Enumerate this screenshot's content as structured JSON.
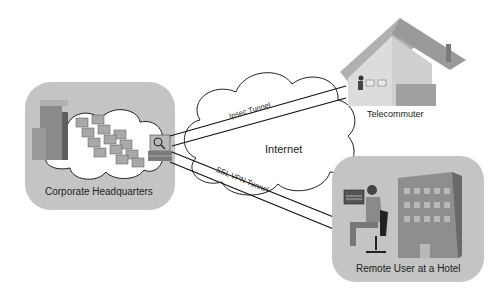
{
  "diagram": {
    "nodes": {
      "hq": {
        "label": "Corporate Headquarters"
      },
      "internet": {
        "label": "Internet"
      },
      "telecommuter": {
        "label": "Telecommuter"
      },
      "hotel": {
        "label": "Remote User at a Hotel"
      }
    },
    "tunnels": {
      "ipsec": {
        "label": "Ipsec Tunnel"
      },
      "ssl": {
        "label": "SSL VPN Tunnel"
      }
    },
    "colors": {
      "panel": "#c4c4c4",
      "cloud": "#ffffff",
      "stroke": "#222222",
      "building": "#8a8a8a",
      "house_wall": "#d8d8d8",
      "house_roof": "#9a9a9a"
    }
  }
}
